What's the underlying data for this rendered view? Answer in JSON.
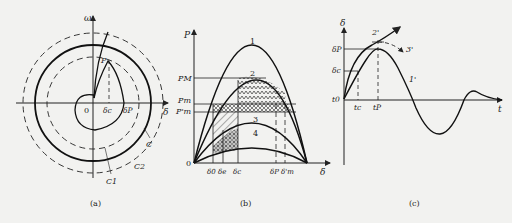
{
  "panels": {
    "a": {
      "caption": "(a)",
      "axis_y": "ω",
      "axis_x": "δ",
      "origin": "0",
      "point": "P",
      "delta_c": "δc",
      "delta_p": "δP",
      "curve_c": "C",
      "curve_c1": "C1",
      "curve_c2": "C2"
    },
    "b": {
      "caption": "(b)",
      "axis_y": "P",
      "axis_x": "δ",
      "origin": "0",
      "p_m_top": "PM",
      "p_m": "Pm",
      "p_m_prime": "P'm",
      "curve_labels": [
        "1",
        "2",
        "3",
        "4"
      ],
      "x_ticks": [
        "δ0",
        "δe",
        "δc",
        "δP",
        "δ'm"
      ]
    },
    "c": {
      "caption": "(c)",
      "axis_y": "δ",
      "axis_x": "t",
      "delta_p": "δP",
      "delta_c": "δc",
      "t0": "t0",
      "tc": "tc",
      "tp": "tP",
      "curve_1": "1'",
      "curve_2": "2'",
      "curve_3": "3'"
    }
  }
}
